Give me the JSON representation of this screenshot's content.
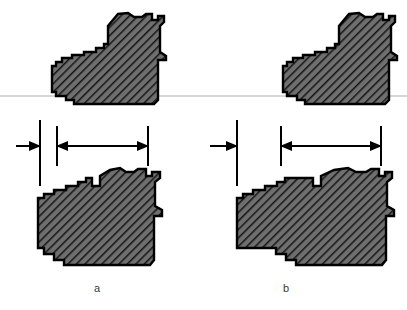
{
  "figure": {
    "type": "engineering-cross-section-comparison",
    "background_color": "#ffffff",
    "outline_color": "#000000",
    "hatch_fill_color": "#6a6a6a",
    "hatch_line_color": "#111111",
    "reference_line_color": "#c9c9c9",
    "dimension_color": "#000000",
    "panels": [
      {
        "id": "a",
        "label": "a",
        "label_x": 94,
        "label_y": 282,
        "reference_line": {
          "y": 96,
          "x1": 0,
          "x2": 407
        },
        "upper_part": {
          "name": "upper-section-a",
          "x_min": 52,
          "x_max": 167,
          "y_min": 12,
          "y_max": 104
        },
        "lower_part": {
          "name": "lower-section-a",
          "x_min": 38,
          "x_max": 163,
          "y_min": 168,
          "y_max": 268
        },
        "dimensions": {
          "line_y": 146,
          "extension_lines": [
            {
              "x": 40,
              "y1": 120,
              "y2": 186,
              "kind": "long"
            },
            {
              "x": 57,
              "y1": 126,
              "y2": 166,
              "kind": "short"
            },
            {
              "x": 148,
              "y1": 126,
              "y2": 166,
              "kind": "short"
            }
          ],
          "arrows": [
            {
              "from_x": 18,
              "to_x": 40,
              "direction": "right",
              "name": "offset-arrow-left"
            },
            {
              "from_x": 77,
              "to_x": 57,
              "direction": "left",
              "name": "width-arrow-left"
            },
            {
              "from_x": 120,
              "to_x": 148,
              "direction": "right",
              "name": "width-arrow-right"
            }
          ]
        }
      },
      {
        "id": "b",
        "label": "b",
        "label_x": 283,
        "label_y": 282,
        "reference_line": {
          "y": 96,
          "x1": 0,
          "x2": 407
        },
        "upper_part": {
          "name": "upper-section-b",
          "x_min": 283,
          "x_max": 390,
          "y_min": 12,
          "y_max": 104
        },
        "lower_part": {
          "name": "lower-section-b",
          "x_min": 237,
          "x_max": 390,
          "y_min": 168,
          "y_max": 268
        },
        "dimensions": {
          "line_y": 146,
          "extension_lines": [
            {
              "x": 237,
              "y1": 120,
              "y2": 186,
              "kind": "long"
            },
            {
              "x": 281,
              "y1": 126,
              "y2": 166,
              "kind": "short"
            },
            {
              "x": 381,
              "y1": 126,
              "y2": 166,
              "kind": "short"
            }
          ],
          "arrows": [
            {
              "from_x": 212,
              "to_x": 237,
              "direction": "right",
              "name": "offset-arrow-left"
            },
            {
              "from_x": 301,
              "to_x": 281,
              "direction": "left",
              "name": "width-arrow-left"
            },
            {
              "from_x": 352,
              "to_x": 381,
              "direction": "right",
              "name": "width-arrow-right"
            }
          ]
        }
      }
    ]
  }
}
